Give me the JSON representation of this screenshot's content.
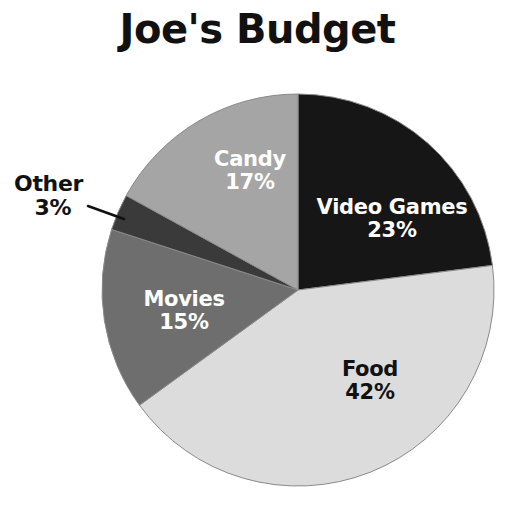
{
  "chart": {
    "title": "Joe's Budget"
  },
  "chart_data": {
    "type": "pie",
    "title": "Joe's Budget",
    "xlabel": "",
    "ylabel": "",
    "legend_position": "none",
    "grid": false,
    "units": "percent",
    "total": 100,
    "categories": [
      "Video Games",
      "Food",
      "Movies",
      "Other",
      "Candy"
    ],
    "values": [
      23,
      42,
      15,
      3,
      17
    ],
    "slices": [
      {
        "label": "Video Games",
        "value": 23,
        "percent_text": "23%",
        "color": "#161616",
        "label_color": "#ffffff",
        "label_placement": "inside",
        "start_angle_deg": 0,
        "end_angle_deg": 82.8
      },
      {
        "label": "Food",
        "value": 42,
        "percent_text": "42%",
        "color": "#dcdcdc",
        "label_color": "#111111",
        "label_placement": "inside",
        "start_angle_deg": 82.8,
        "end_angle_deg": 234.0
      },
      {
        "label": "Movies",
        "value": 15,
        "percent_text": "15%",
        "color": "#6e6e6e",
        "label_color": "#ffffff",
        "label_placement": "inside",
        "start_angle_deg": 234.0,
        "end_angle_deg": 288.0
      },
      {
        "label": "Other",
        "value": 3,
        "percent_text": "3%",
        "color": "#3a3a3a",
        "label_color": "#111111",
        "label_placement": "outside",
        "start_angle_deg": 288.0,
        "end_angle_deg": 298.8
      },
      {
        "label": "Candy",
        "value": 17,
        "percent_text": "17%",
        "color": "#a5a5a5",
        "label_color": "#ffffff",
        "label_placement": "inside",
        "start_angle_deg": 298.8,
        "end_angle_deg": 360.0
      }
    ],
    "geometry": {
      "center_x": 298,
      "center_y": 290,
      "radius": 196,
      "direction": "clockwise",
      "start_at": "12 o'clock"
    },
    "leader_line": {
      "from_x": 88,
      "from_y": 206,
      "to_x": 124,
      "to_y": 219,
      "color": "#111111"
    },
    "background_color": "#ffffff"
  }
}
